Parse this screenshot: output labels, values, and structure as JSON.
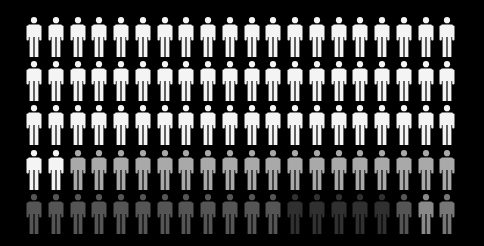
{
  "figure": {
    "type": "isotype-pictogram-grid",
    "icon": "person-icon",
    "rows": 5,
    "columns": 20,
    "total": 100,
    "background": "#000000",
    "legend_colors": {
      "white": "#f4f4f4",
      "light_gray": "#a9a9a9",
      "mid_gray": "#555555",
      "dark_gray": "#303030",
      "gray_light_b": "#8a8a8a",
      "gray_light_c": "#777777"
    },
    "row_colors": [
      [
        "white",
        "white",
        "white",
        "white",
        "white",
        "white",
        "white",
        "white",
        "white",
        "white",
        "white",
        "white",
        "white",
        "white",
        "white",
        "white",
        "white",
        "white",
        "white",
        "white"
      ],
      [
        "white",
        "white",
        "white",
        "white",
        "white",
        "white",
        "white",
        "white",
        "white",
        "white",
        "white",
        "white",
        "white",
        "white",
        "white",
        "white",
        "white",
        "white",
        "white",
        "white"
      ],
      [
        "white",
        "white",
        "white",
        "white",
        "white",
        "white",
        "white",
        "white",
        "white",
        "white",
        "white",
        "white",
        "white",
        "white",
        "white",
        "white",
        "white",
        "white",
        "white",
        "white"
      ],
      [
        "white",
        "white",
        "light_gray",
        "light_gray",
        "light_gray",
        "light_gray",
        "light_gray",
        "light_gray",
        "light_gray",
        "light_gray",
        "light_gray",
        "light_gray",
        "light_gray",
        "light_gray",
        "light_gray",
        "light_gray",
        "light_gray",
        "light_gray",
        "light_gray",
        "light_gray"
      ],
      [
        "mid_gray",
        "mid_gray",
        "mid_gray",
        "mid_gray",
        "mid_gray",
        "mid_gray",
        "mid_gray",
        "mid_gray",
        "mid_gray",
        "mid_gray",
        "mid_gray",
        "mid_gray",
        "dark_gray",
        "dark_gray",
        "dark_gray",
        "dark_gray",
        "dark_gray",
        "mid_gray",
        "gray_light_b",
        "gray_light_c"
      ]
    ],
    "counts": {
      "white": 62,
      "light_gray": 18,
      "mid_gray": 15,
      "dark_gray": 5
    }
  }
}
